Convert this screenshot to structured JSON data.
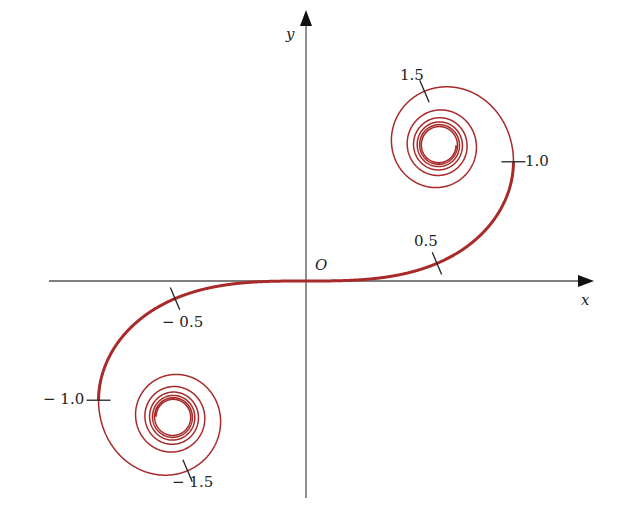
{
  "figure": {
    "type": "Cornu (Euler) spiral",
    "axes": {
      "x_label": "x",
      "y_label": "y",
      "origin_label": "O"
    },
    "curve": {
      "color": "#a82a2a",
      "t_range": [
        -5,
        5
      ]
    },
    "ticks": [
      {
        "t": 0.5,
        "label": "0.5"
      },
      {
        "t": 1.0,
        "label": "1.0"
      },
      {
        "t": 1.5,
        "label": "1.5"
      },
      {
        "t": -0.5,
        "label": "− 0.5"
      },
      {
        "t": -1.0,
        "label": "− 1.0"
      },
      {
        "t": -1.5,
        "label": "− 1.5"
      }
    ]
  }
}
